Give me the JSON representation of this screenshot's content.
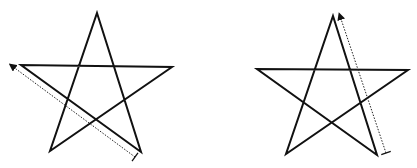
{
  "figure": {
    "description": "Two pentagram stroke-order diagrams with dotted arrows indicating stroke direction",
    "colors": {
      "stroke": "#111111",
      "background": "#ffffff",
      "arrow": "#222222"
    },
    "panels": [
      {
        "id": "left",
        "star_points": "97,13 141,152 21,65 172,67 50,151",
        "arrow": {
          "from": [
            135,
            157
          ],
          "to": [
            12,
            66
          ],
          "style": "dotted",
          "tick": true
        },
        "highlighted_stroke": "bottom-right to left point"
      },
      {
        "id": "right",
        "star_points": "333,16 377,155 257,69 408,70 286,154",
        "arrow": {
          "from": [
            386,
            153
          ],
          "to": [
            340,
            16
          ],
          "style": "dotted",
          "tick": true
        },
        "highlighted_stroke": "bottom-right to top point"
      }
    ]
  }
}
